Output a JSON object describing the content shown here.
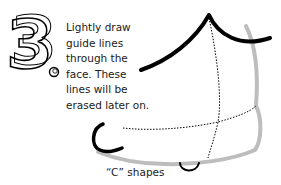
{
  "step": {
    "number": "3",
    "instruction_lines": [
      "Lightly draw",
      "guide lines",
      "through the",
      "face. These",
      "lines will be",
      "erased later on."
    ]
  },
  "caption": "“C” shapes",
  "colors": {
    "ink": "#000000",
    "sketch_gray": "#bdbdbd",
    "text": "#1a1a1a",
    "background": "#ffffff"
  }
}
